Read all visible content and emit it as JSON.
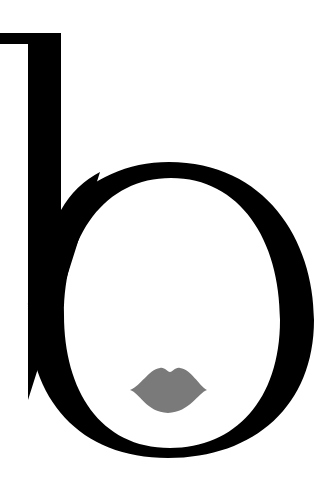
{
  "logo": {
    "letter": "b",
    "letter_color": "#000000",
    "lips_color": "#7a7a7a",
    "background": "#ffffff"
  }
}
